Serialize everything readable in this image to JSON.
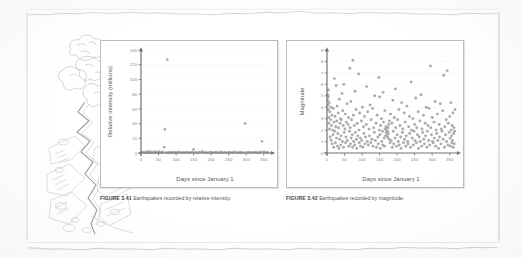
{
  "page": {
    "kind": "scanned-textbook-page",
    "illustration_name": "earthquake-fissure-pencil-sketch"
  },
  "figure_341": {
    "caption_label": "FIGURE 3.41",
    "caption_text": "Earthquakes recorded by relative intensity."
  },
  "figure_342": {
    "caption_label": "FIGURE 3.42",
    "caption_text": "Earthquakes recorded by magnitude."
  },
  "colors": {
    "marker": "#9a9da3",
    "axis": "#6f7276",
    "frame": "#b9bcc0",
    "gridline": "#f1f2f4",
    "tick_text": "#83868b",
    "axis_title": "#55585c",
    "caption_text": "#4e5155",
    "page": "#ffffff"
  },
  "chart_data": [
    {
      "type": "scatter",
      "title": "",
      "xlabel": "Days since January 1",
      "ylabel": "Relative intensity (millions)",
      "xlim": [
        0,
        365
      ],
      "ylim": [
        0,
        140
      ],
      "xticks": [
        0,
        50,
        100,
        150,
        200,
        250,
        300,
        350
      ],
      "yticks": [
        0,
        20,
        40,
        60,
        80,
        100,
        120,
        140
      ],
      "grid": true,
      "legend": "none",
      "marker_color": "#9a9da3",
      "points": [
        [
          75,
          127
        ],
        [
          68,
          32
        ],
        [
          297,
          40
        ],
        [
          345,
          16
        ],
        [
          66,
          8
        ],
        [
          150,
          5
        ],
        [
          3,
          1.2
        ],
        [
          6,
          0.6
        ],
        [
          9,
          1.0
        ],
        [
          12,
          0.5
        ],
        [
          15,
          1.4
        ],
        [
          18,
          0.7
        ],
        [
          21,
          2.2
        ],
        [
          24,
          1.1
        ],
        [
          27,
          0.5
        ],
        [
          30,
          1.6
        ],
        [
          33,
          0.8
        ],
        [
          36,
          1.0
        ],
        [
          39,
          2.0
        ],
        [
          42,
          0.6
        ],
        [
          45,
          1.3
        ],
        [
          48,
          0.9
        ],
        [
          51,
          1.8
        ],
        [
          54,
          0.5
        ],
        [
          57,
          1.1
        ],
        [
          60,
          0.8
        ],
        [
          63,
          1.5
        ],
        [
          72,
          0.6
        ],
        [
          78,
          1.0
        ],
        [
          82,
          0.7
        ],
        [
          86,
          1.3
        ],
        [
          90,
          0.5
        ],
        [
          94,
          0.9
        ],
        [
          98,
          1.1
        ],
        [
          103,
          0.6
        ],
        [
          107,
          1.4
        ],
        [
          112,
          0.8
        ],
        [
          117,
          0.5
        ],
        [
          122,
          1.0
        ],
        [
          127,
          0.7
        ],
        [
          132,
          1.2
        ],
        [
          137,
          0.6
        ],
        [
          142,
          0.9
        ],
        [
          147,
          1.5
        ],
        [
          155,
          0.8
        ],
        [
          160,
          0.6
        ],
        [
          165,
          1.1
        ],
        [
          170,
          0.9
        ],
        [
          175,
          2.4
        ],
        [
          180,
          0.7
        ],
        [
          185,
          1.0
        ],
        [
          190,
          0.5
        ],
        [
          196,
          1.3
        ],
        [
          201,
          0.8
        ],
        [
          206,
          0.6
        ],
        [
          212,
          1.1
        ],
        [
          217,
          0.9
        ],
        [
          222,
          0.5
        ],
        [
          228,
          1.4
        ],
        [
          233,
          0.7
        ],
        [
          239,
          1.0
        ],
        [
          244,
          0.6
        ],
        [
          250,
          1.2
        ],
        [
          255,
          0.8
        ],
        [
          261,
          0.5
        ],
        [
          266,
          1.6
        ],
        [
          272,
          0.9
        ],
        [
          277,
          0.6
        ],
        [
          283,
          1.1
        ],
        [
          288,
          0.7
        ],
        [
          293,
          0.5
        ],
        [
          302,
          1.0
        ],
        [
          307,
          0.8
        ],
        [
          312,
          1.3
        ],
        [
          317,
          0.6
        ],
        [
          322,
          0.9
        ],
        [
          327,
          1.1
        ],
        [
          332,
          0.5
        ],
        [
          337,
          0.8
        ],
        [
          342,
          1.4
        ],
        [
          350,
          2.0
        ],
        [
          355,
          0.7
        ],
        [
          360,
          1.0
        ],
        [
          363,
          0.6
        ]
      ]
    },
    {
      "type": "scatter",
      "title": "",
      "xlabel": "Days since January 1",
      "ylabel": "Magnitude",
      "xlim": [
        0,
        365
      ],
      "ylim": [
        0,
        9
      ],
      "xticks": [
        0,
        50,
        100,
        150,
        200,
        250,
        300,
        350
      ],
      "yticks": [
        0,
        1,
        2,
        3,
        4,
        5,
        6,
        7,
        8,
        9
      ],
      "grid": true,
      "legend": "none",
      "marker_color": "#9a9da3",
      "points": [
        [
          2,
          5.1
        ],
        [
          2,
          4.6
        ],
        [
          3,
          4.2
        ],
        [
          3,
          3.8
        ],
        [
          4,
          5.5
        ],
        [
          4,
          4.9
        ],
        [
          5,
          3.1
        ],
        [
          5,
          2.6
        ],
        [
          6,
          4.4
        ],
        [
          7,
          2.1
        ],
        [
          8,
          3.6
        ],
        [
          9,
          1.4
        ],
        [
          10,
          2.9
        ],
        [
          11,
          4.0
        ],
        [
          12,
          1.1
        ],
        [
          13,
          2.4
        ],
        [
          14,
          3.3
        ],
        [
          15,
          0.8
        ],
        [
          16,
          2.0
        ],
        [
          17,
          1.6
        ],
        [
          18,
          3.9
        ],
        [
          19,
          0.5
        ],
        [
          20,
          2.7
        ],
        [
          21,
          6.5
        ],
        [
          22,
          1.9
        ],
        [
          23,
          3.2
        ],
        [
          24,
          0.9
        ],
        [
          25,
          2.3
        ],
        [
          26,
          5.9
        ],
        [
          27,
          1.3
        ],
        [
          28,
          2.8
        ],
        [
          29,
          4.1
        ],
        [
          30,
          0.6
        ],
        [
          31,
          1.7
        ],
        [
          32,
          3.5
        ],
        [
          33,
          2.2
        ],
        [
          34,
          0.4
        ],
        [
          35,
          4.7
        ],
        [
          36,
          1.2
        ],
        [
          37,
          2.6
        ],
        [
          38,
          3.0
        ],
        [
          39,
          0.7
        ],
        [
          40,
          1.5
        ],
        [
          41,
          2.9
        ],
        [
          43,
          5.2
        ],
        [
          44,
          1.0
        ],
        [
          45,
          3.7
        ],
        [
          46,
          2.4
        ],
        [
          47,
          0.5
        ],
        [
          48,
          6.0
        ],
        [
          49,
          1.8
        ],
        [
          51,
          2.1
        ],
        [
          52,
          3.4
        ],
        [
          53,
          0.9
        ],
        [
          54,
          1.4
        ],
        [
          55,
          2.7
        ],
        [
          57,
          4.3
        ],
        [
          58,
          1.1
        ],
        [
          60,
          2.5
        ],
        [
          61,
          3.1
        ],
        [
          62,
          0.6
        ],
        [
          64,
          1.9
        ],
        [
          65,
          7.4
        ],
        [
          66,
          2.2
        ],
        [
          67,
          0.8
        ],
        [
          68,
          4.5
        ],
        [
          69,
          1.3
        ],
        [
          70,
          2.9
        ],
        [
          72,
          1.6
        ],
        [
          73,
          0.5
        ],
        [
          74,
          8.1
        ],
        [
          75,
          3.3
        ],
        [
          76,
          1.0
        ],
        [
          78,
          2.4
        ],
        [
          79,
          0.7
        ],
        [
          80,
          5.4
        ],
        [
          81,
          1.8
        ],
        [
          83,
          3.8
        ],
        [
          84,
          1.2
        ],
        [
          85,
          0.4
        ],
        [
          86,
          2.6
        ],
        [
          88,
          1.5
        ],
        [
          90,
          6.9
        ],
        [
          91,
          2.0
        ],
        [
          92,
          0.9
        ],
        [
          93,
          3.5
        ],
        [
          95,
          1.3
        ],
        [
          96,
          0.6
        ],
        [
          98,
          2.8
        ],
        [
          99,
          1.1
        ],
        [
          101,
          4.0
        ],
        [
          102,
          0.5
        ],
        [
          104,
          2.3
        ],
        [
          105,
          1.7
        ],
        [
          107,
          3.2
        ],
        [
          108,
          0.8
        ],
        [
          110,
          1.4
        ],
        [
          112,
          2.5
        ],
        [
          113,
          5.8
        ],
        [
          115,
          1.0
        ],
        [
          116,
          3.6
        ],
        [
          118,
          0.7
        ],
        [
          120,
          2.1
        ],
        [
          121,
          1.5
        ],
        [
          123,
          4.2
        ],
        [
          125,
          0.9
        ],
        [
          126,
          2.9
        ],
        [
          128,
          1.2
        ],
        [
          130,
          3.9
        ],
        [
          131,
          0.6
        ],
        [
          133,
          2.2
        ],
        [
          135,
          1.8
        ],
        [
          136,
          5.0
        ],
        [
          138,
          1.1
        ],
        [
          140,
          2.6
        ],
        [
          141,
          0.5
        ],
        [
          143,
          3.3
        ],
        [
          145,
          1.4
        ],
        [
          146,
          0.8
        ],
        [
          148,
          6.6
        ],
        [
          149,
          2.0
        ],
        [
          150,
          4.9
        ],
        [
          151,
          1.6
        ],
        [
          152,
          0.4
        ],
        [
          153,
          2.4
        ],
        [
          155,
          3.0
        ],
        [
          156,
          1.0
        ],
        [
          158,
          1.9
        ],
        [
          159,
          0.7
        ],
        [
          160,
          5.3
        ],
        [
          161,
          2.7
        ],
        [
          163,
          1.3
        ],
        [
          164,
          0.6
        ],
        [
          165,
          3.7
        ],
        [
          166,
          2.1
        ],
        [
          167,
          1.5
        ],
        [
          168,
          2.3
        ],
        [
          169,
          1.8
        ],
        [
          170,
          2.0
        ],
        [
          171,
          1.6
        ],
        [
          172,
          1.9
        ],
        [
          173,
          1.4
        ],
        [
          174,
          2.2
        ],
        [
          175,
          1.7
        ],
        [
          176,
          2.5
        ],
        [
          177,
          1.2
        ],
        [
          178,
          2.8
        ],
        [
          180,
          0.9
        ],
        [
          181,
          3.4
        ],
        [
          183,
          1.1
        ],
        [
          185,
          2.6
        ],
        [
          186,
          0.5
        ],
        [
          188,
          4.6
        ],
        [
          189,
          1.9
        ],
        [
          190,
          0.8
        ],
        [
          192,
          3.1
        ],
        [
          194,
          1.3
        ],
        [
          195,
          5.6
        ],
        [
          196,
          2.2
        ],
        [
          198,
          0.6
        ],
        [
          200,
          1.6
        ],
        [
          201,
          2.9
        ],
        [
          203,
          1.0
        ],
        [
          205,
          3.8
        ],
        [
          206,
          0.7
        ],
        [
          208,
          2.4
        ],
        [
          210,
          1.4
        ],
        [
          211,
          0.4
        ],
        [
          213,
          4.4
        ],
        [
          215,
          1.8
        ],
        [
          216,
          2.1
        ],
        [
          218,
          0.9
        ],
        [
          220,
          3.5
        ],
        [
          221,
          1.2
        ],
        [
          223,
          2.7
        ],
        [
          225,
          0.6
        ],
        [
          226,
          1.5
        ],
        [
          228,
          4.1
        ],
        [
          230,
          1.0
        ],
        [
          231,
          0.8
        ],
        [
          233,
          2.3
        ],
        [
          235,
          3.2
        ],
        [
          236,
          1.7
        ],
        [
          238,
          0.5
        ],
        [
          240,
          6.2
        ],
        [
          241,
          2.0
        ],
        [
          243,
          1.3
        ],
        [
          245,
          3.0
        ],
        [
          246,
          0.7
        ],
        [
          248,
          1.9
        ],
        [
          250,
          2.5
        ],
        [
          251,
          1.1
        ],
        [
          253,
          4.8
        ],
        [
          255,
          0.9
        ],
        [
          256,
          2.2
        ],
        [
          258,
          1.6
        ],
        [
          260,
          3.6
        ],
        [
          261,
          0.4
        ],
        [
          263,
          1.4
        ],
        [
          265,
          2.8
        ],
        [
          266,
          1.0
        ],
        [
          268,
          5.1
        ],
        [
          270,
          0.6
        ],
        [
          271,
          2.1
        ],
        [
          273,
          1.8
        ],
        [
          275,
          3.3
        ],
        [
          276,
          1.2
        ],
        [
          278,
          0.8
        ],
        [
          280,
          2.6
        ],
        [
          281,
          1.5
        ],
        [
          283,
          4.0
        ],
        [
          285,
          0.5
        ],
        [
          286,
          1.9
        ],
        [
          288,
          2.4
        ],
        [
          290,
          1.1
        ],
        [
          291,
          3.9
        ],
        [
          293,
          0.7
        ],
        [
          295,
          7.6
        ],
        [
          296,
          2.2
        ],
        [
          298,
          1.6
        ],
        [
          300,
          3.1
        ],
        [
          301,
          1.0
        ],
        [
          303,
          0.9
        ],
        [
          305,
          2.7
        ],
        [
          306,
          1.3
        ],
        [
          308,
          4.5
        ],
        [
          310,
          0.6
        ],
        [
          311,
          2.0
        ],
        [
          313,
          1.7
        ],
        [
          315,
          3.4
        ],
        [
          316,
          1.1
        ],
        [
          318,
          0.4
        ],
        [
          320,
          2.5
        ],
        [
          321,
          1.4
        ],
        [
          323,
          4.3
        ],
        [
          325,
          0.8
        ],
        [
          326,
          2.1
        ],
        [
          328,
          1.9
        ],
        [
          330,
          3.7
        ],
        [
          331,
          1.2
        ],
        [
          333,
          6.8
        ],
        [
          335,
          0.5
        ],
        [
          336,
          2.3
        ],
        [
          338,
          1.6
        ],
        [
          340,
          2.9
        ],
        [
          341,
          1.0
        ],
        [
          343,
          7.2
        ],
        [
          345,
          0.7
        ],
        [
          346,
          2.6
        ],
        [
          348,
          1.8
        ],
        [
          350,
          3.2
        ],
        [
          351,
          1.3
        ],
        [
          352,
          0.6
        ],
        [
          353,
          4.4
        ],
        [
          354,
          2.0
        ],
        [
          355,
          1.5
        ],
        [
          356,
          0.9
        ],
        [
          357,
          2.4
        ],
        [
          358,
          1.1
        ],
        [
          359,
          3.5
        ],
        [
          360,
          0.5
        ],
        [
          361,
          1.7
        ],
        [
          362,
          2.2
        ],
        [
          363,
          0.8
        ],
        [
          364,
          1.9
        ],
        [
          365,
          3.8
        ]
      ]
    }
  ]
}
